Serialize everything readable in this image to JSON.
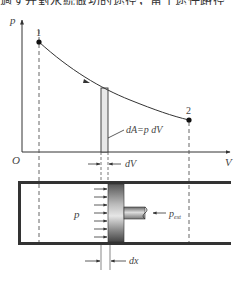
{
  "header": {
    "cut_text": "過ず并對永統做功的途径，留于途任路径"
  },
  "diagram": {
    "axis_p_label": "p",
    "axis_v_label": "V",
    "origin_label": "O",
    "point_1_label": "1",
    "point_2_label": "2",
    "work_element_label": "dA=p dV",
    "dv_label": "dV",
    "gas_pressure_label": "p",
    "external_pressure_label": "p",
    "external_pressure_subscript": "ext",
    "dx_label": "dx"
  }
}
